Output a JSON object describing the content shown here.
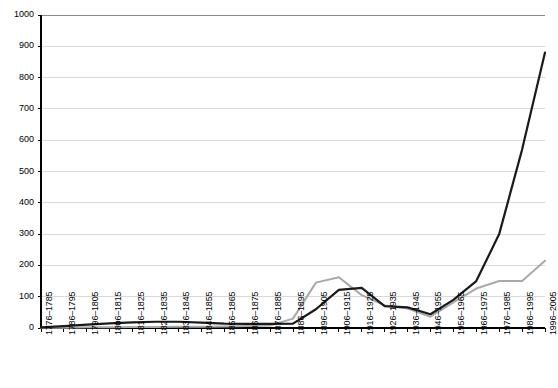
{
  "chart_data": {
    "type": "line",
    "title": "",
    "xlabel": "",
    "ylabel": "",
    "ylim": [
      0,
      1000
    ],
    "ytick_step": 100,
    "grid": true,
    "legend_position": "none",
    "yticks": [
      0,
      100,
      200,
      300,
      400,
      500,
      600,
      700,
      800,
      900,
      1000
    ],
    "categories": [
      "1776–1785",
      "1786–1795",
      "1796–1805",
      "1806–1815",
      "1816–1825",
      "1826–1835",
      "1836–1845",
      "1846–1855",
      "1856–1865",
      "1866–1875",
      "1876–1885",
      "1886–1895",
      "1896–1905",
      "1906–1915",
      "1916–1925",
      "1926–1935",
      "1936–1945",
      "1946–1955",
      "1956–1965",
      "1966–1975",
      "1976–1985",
      "1986–1995",
      "1996–2005"
    ],
    "series": [
      {
        "name": "series-dark",
        "color": "#1a1a1a",
        "width": 2.2,
        "values": [
          2,
          6,
          11,
          15,
          18,
          20,
          20,
          17,
          14,
          13,
          13,
          14,
          60,
          122,
          128,
          70,
          66,
          44,
          90,
          150,
          300,
          570,
          880
        ]
      },
      {
        "name": "series-gray",
        "color": "#a9a9a9",
        "width": 2.0,
        "values": [
          1,
          1,
          2,
          2,
          3,
          3,
          4,
          4,
          5,
          6,
          8,
          30,
          145,
          162,
          105,
          72,
          62,
          36,
          82,
          126,
          150,
          150,
          215
        ]
      }
    ]
  },
  "plot": {
    "left": 41,
    "right": 545,
    "top": 15,
    "bottom": 328,
    "axis_color": "#000000",
    "grid_color": "#d9d9d9",
    "background": "#ffffff"
  }
}
